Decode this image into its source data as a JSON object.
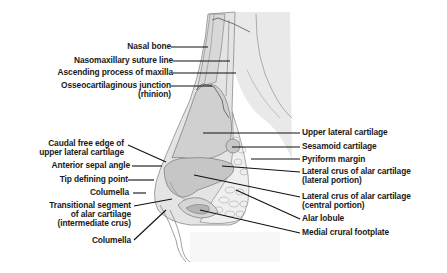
{
  "figure": {
    "type": "anatomical-diagram",
    "labels_left": [
      {
        "id": "nasal-bone",
        "lines": [
          "Nasal bone"
        ]
      },
      {
        "id": "nasomaxillary-suture-line",
        "lines": [
          "Nasomaxillary suture line"
        ]
      },
      {
        "id": "ascending-process-of-maxilla",
        "lines": [
          "Ascending process of maxilla"
        ]
      },
      {
        "id": "osseocartilaginous-junction",
        "lines": [
          "Osseocartilaginous junction",
          "(rhinion)"
        ]
      },
      {
        "id": "caudal-free-edge",
        "lines": [
          "Caudal free edge of",
          "upper lateral cartilage"
        ]
      },
      {
        "id": "anterior-septal-angle",
        "lines": [
          "Anterior sepal angle"
        ]
      },
      {
        "id": "tip-defining-point",
        "lines": [
          "Tip defining point"
        ]
      },
      {
        "id": "columella-1",
        "lines": [
          "Columella"
        ]
      },
      {
        "id": "transitional-segment",
        "lines": [
          "Transitional segment",
          "of alar cartilage",
          "(intermediate crus)"
        ]
      },
      {
        "id": "columella-2",
        "lines": [
          "Columella"
        ]
      }
    ],
    "labels_right": [
      {
        "id": "upper-lateral-cartilage",
        "lines": [
          "Upper lateral cartilage"
        ]
      },
      {
        "id": "sesamoid-cartilage",
        "lines": [
          "Sesamoid cartilage"
        ]
      },
      {
        "id": "pyriform-margin",
        "lines": [
          "Pyriform margin"
        ]
      },
      {
        "id": "lateral-crus-lateral",
        "lines": [
          "Lateral crus of alar cartilage",
          "(lateral portion)"
        ]
      },
      {
        "id": "lateral-crus-central",
        "lines": [
          "Lateral crus of alar cartilage",
          "(central portion)"
        ]
      },
      {
        "id": "alar-lobule",
        "lines": [
          "Alar lobule"
        ]
      },
      {
        "id": "medial-crural-footplate",
        "lines": [
          "Medial crural footplate"
        ]
      }
    ],
    "colors": {
      "skin": "#e6e6e6",
      "bone": "#d4d4d4",
      "cartilage": "#c4c4c4",
      "fibrofatty": "#eeeeee",
      "outline": "#7a7a7a",
      "leader": "#111111",
      "text": "#1a1a1a"
    }
  }
}
